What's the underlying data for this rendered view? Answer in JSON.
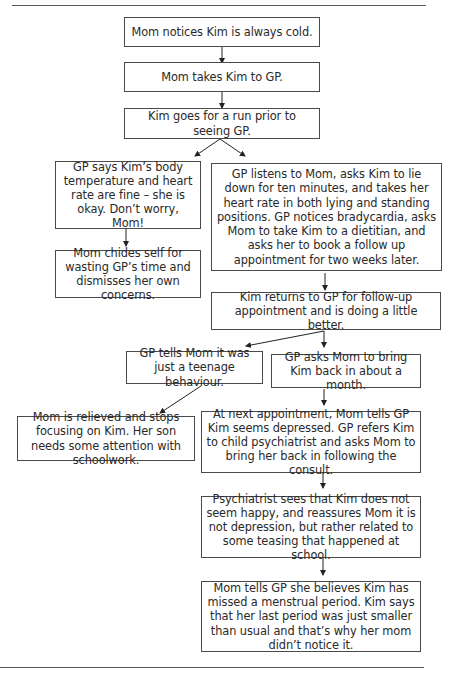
{
  "diagram": {
    "type": "flowchart",
    "nodes": [
      {
        "id": "n1",
        "text": "Mom notices Kim is always cold."
      },
      {
        "id": "n2",
        "text": "Mom takes Kim to GP."
      },
      {
        "id": "n3",
        "text": "Kim goes for a run prior to seeing GP."
      },
      {
        "id": "n4",
        "text": "GP says Kim’s body temperature and heart rate are fine – she is okay. Don’t worry, Mom!"
      },
      {
        "id": "n5",
        "text": "GP listens to Mom, asks Kim to lie down for ten minutes, and takes her heart rate in both lying and standing positions. GP notices bradycardia, asks Mom to take Kim to a dietitian, and asks her to book a follow up appointment for two weeks later."
      },
      {
        "id": "n6",
        "text": "Mom chides self for wasting GP’s time and dismisses her own concerns."
      },
      {
        "id": "n7",
        "text": "Kim returns to GP for follow-up appointment and is doing a little better."
      },
      {
        "id": "n8",
        "text": "GP tells Mom it was just a teenage behaviour."
      },
      {
        "id": "n9",
        "text": "GP asks Mom to bring Kim back in about a month."
      },
      {
        "id": "n10",
        "text": "Mom is relieved and stops focusing on Kim. Her son needs some attention with schoolwork."
      },
      {
        "id": "n11",
        "text": "At next appointment, Mom tells GP Kim seems depressed. GP refers Kim to child psychiatrist and asks Mom to bring her back in following the consult."
      },
      {
        "id": "n12",
        "text": "Psychiatrist sees that Kim does not seem happy, and reassures Mom it is not depression, but rather related to some teasing that happened at school."
      },
      {
        "id": "n13",
        "text": "Mom tells GP she believes Kim has missed a menstrual period. Kim says that her last period was just smaller than usual and that’s why her mom didn’t notice it."
      }
    ],
    "edges": [
      [
        "n1",
        "n2"
      ],
      [
        "n2",
        "n3"
      ],
      [
        "n3",
        "n4"
      ],
      [
        "n3",
        "n5"
      ],
      [
        "n4",
        "n6"
      ],
      [
        "n5",
        "n7"
      ],
      [
        "n7",
        "n8"
      ],
      [
        "n7",
        "n9"
      ],
      [
        "n8",
        "n10"
      ],
      [
        "n9",
        "n11"
      ],
      [
        "n11",
        "n12"
      ],
      [
        "n12",
        "n13"
      ]
    ]
  }
}
